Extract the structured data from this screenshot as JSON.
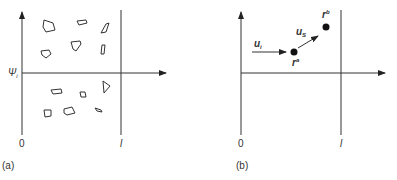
{
  "panel_a": {
    "label": "(a)",
    "y_axis_label": "Ψ",
    "y_axis_sub": "i",
    "origin_label": "0",
    "x_end_label": "l"
  },
  "panel_b": {
    "label": "(b)",
    "origin_label": "0",
    "x_end_label": "l",
    "u_i": "u",
    "u_i_sub": "i",
    "u_s": "u",
    "u_s_sub": "S",
    "r_a": "r",
    "r_a_sup": "a",
    "r_b": "r",
    "r_b_sup": "b"
  }
}
